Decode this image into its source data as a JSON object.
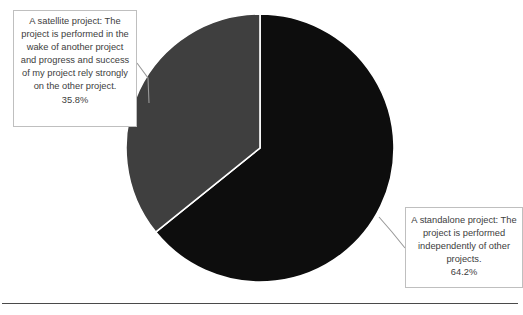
{
  "figure": {
    "background_color": "#ffffff",
    "baseline_rule_color": "#4a4a4a"
  },
  "callouts": {
    "satellite": {
      "text": "A satellite project: The project is performed in the wake of another project and progress and success of my project rely strongly  on the other project.",
      "value": "35.8%",
      "border_color": "#bfbfbf",
      "leader_color": "#9a9a9a"
    },
    "standalone": {
      "text": "A standalone project: The project is performed independently of other projects.",
      "value": "64.2%",
      "border_color": "#bfbfbf",
      "leader_color": "#9a9a9a"
    }
  },
  "chart_data": {
    "type": "pie",
    "title": "",
    "labels": [
      "A standalone project: The project is performed independently of other projects.",
      "A satellite project: The project is performed in the wake of another project and progress and success of my project rely strongly  on the other project."
    ],
    "values": [
      64.2,
      35.8
    ],
    "value_labels": [
      "64.2%",
      "35.8%"
    ],
    "colors": [
      "#0d0d0d",
      "#3f3f3f"
    ],
    "slice_border_color": "#ffffff",
    "start_angle_deg": 90,
    "direction": "clockwise",
    "legend": "none",
    "grid": false,
    "center": {
      "x": 260,
      "y": 148
    },
    "radius": 134
  }
}
